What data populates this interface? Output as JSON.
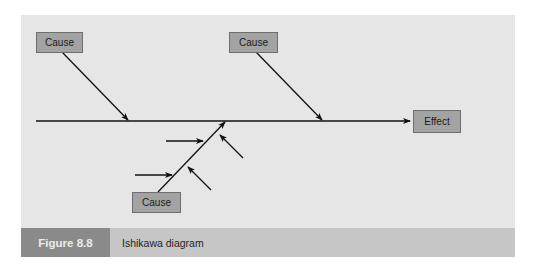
{
  "diagram": {
    "type": "ishikawa",
    "causes": [
      {
        "id": "cause-top-left",
        "label": "Cause"
      },
      {
        "id": "cause-top-right",
        "label": "Cause"
      },
      {
        "id": "cause-bottom",
        "label": "Cause"
      }
    ],
    "effect": {
      "label": "Effect"
    },
    "colors": {
      "panel": "#e6e6e6",
      "box": "#a3a3a3",
      "line": "#111111",
      "footer": "#c6c6c6",
      "figure_label_bg": "#8a8a8a"
    }
  },
  "caption": {
    "figure_number": "Figure 8.8",
    "title": "Ishikawa diagram"
  }
}
